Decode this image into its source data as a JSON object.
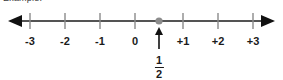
{
  "caption": "Example:",
  "number_line": {
    "axis_color": "#1b1b1b",
    "tick_color": "#8a8a8a",
    "point_color": "#8c8c8c",
    "pointer_color": "#111111",
    "labels": [
      "-3",
      "-2",
      "-1",
      "0",
      "+1",
      "+2",
      "+3"
    ],
    "values": [
      -3,
      -2,
      -1,
      0,
      1,
      2,
      3
    ],
    "marked_point_label_numerator": "1",
    "marked_point_label_denominator": "2",
    "marked_point_value": "1/2",
    "left_arrow": "left-arrowhead",
    "right_arrow": "right-arrowhead",
    "pointer": "up-arrow-pointer"
  }
}
